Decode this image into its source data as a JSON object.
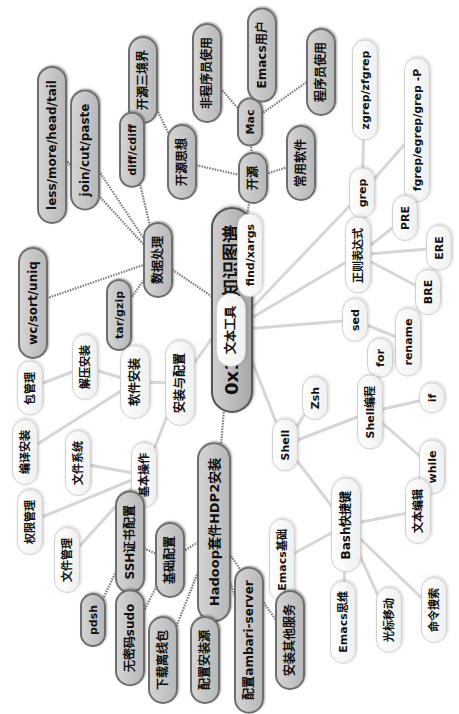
{
  "mindmap": {
    "root": {
      "id": "root",
      "label": "0x1 Linux知识图谱",
      "x": 232,
      "y": 310
    },
    "nodes": [
      {
        "id": "kaiyuan",
        "label": "开源",
        "x": 253,
        "y": 178,
        "style": "gray",
        "size": "m"
      },
      {
        "id": "mac",
        "label": "Mac",
        "x": 250,
        "y": 122,
        "style": "gray",
        "size": "s"
      },
      {
        "id": "emacs_user",
        "label": "Emacs用户",
        "x": 262,
        "y": 55,
        "style": "gray",
        "size": "m"
      },
      {
        "id": "programmer_use",
        "label": "程序员使用",
        "x": 321,
        "y": 72,
        "style": "gray",
        "size": "m"
      },
      {
        "id": "non_programmer_use",
        "label": "非程序员使用",
        "x": 207,
        "y": 73,
        "style": "gray",
        "size": "m"
      },
      {
        "id": "kaiyuan_sixiang",
        "label": "开源思想",
        "x": 182,
        "y": 162,
        "style": "gray",
        "size": "m"
      },
      {
        "id": "kaiyuan_sanjingjie",
        "label": "开源三境界",
        "x": 143,
        "y": 80,
        "style": "gray",
        "size": "m"
      },
      {
        "id": "changyong_ruanjian",
        "label": "常用软件",
        "x": 301,
        "y": 163,
        "style": "gray",
        "size": "m"
      },
      {
        "id": "shuju_chuli",
        "label": "数据处理",
        "x": 158,
        "y": 260,
        "style": "gray",
        "size": "m"
      },
      {
        "id": "less_more",
        "label": "less/more/head/tail",
        "x": 52,
        "y": 145,
        "style": "gray",
        "size": "m"
      },
      {
        "id": "join_cut",
        "label": "join/cut/paste",
        "x": 85,
        "y": 150,
        "style": "gray",
        "size": "m"
      },
      {
        "id": "diff",
        "label": "diff/cdiff",
        "x": 132,
        "y": 150,
        "style": "gray",
        "size": "s"
      },
      {
        "id": "wc_sort",
        "label": "wc/sort/uniq",
        "x": 33,
        "y": 303,
        "style": "gray",
        "size": "m"
      },
      {
        "id": "tar_gzip",
        "label": "tar/gzip",
        "x": 119,
        "y": 315,
        "style": "gray",
        "size": "s"
      },
      {
        "id": "wenben_gongju",
        "label": "文本工具",
        "x": 231,
        "y": 330,
        "style": "white",
        "size": "m"
      },
      {
        "id": "find_xargs",
        "label": "find/xargs",
        "x": 250,
        "y": 255,
        "style": "white",
        "size": "s"
      },
      {
        "id": "grep",
        "label": "grep",
        "x": 362,
        "y": 193,
        "style": "white",
        "size": "s"
      },
      {
        "id": "zgrep",
        "label": "zgrep/zfgrep",
        "x": 365,
        "y": 90,
        "style": "white",
        "size": "s"
      },
      {
        "id": "fgrep",
        "label": "fgrep/egrep/grep -P",
        "x": 417,
        "y": 130,
        "style": "white",
        "size": "s"
      },
      {
        "id": "zhengze",
        "label": "正则表达式",
        "x": 358,
        "y": 255,
        "style": "white",
        "size": "s"
      },
      {
        "id": "pre",
        "label": "PRE",
        "x": 405,
        "y": 218,
        "style": "white",
        "size": "s"
      },
      {
        "id": "ere",
        "label": "ERE",
        "x": 439,
        "y": 248,
        "style": "white",
        "size": "s"
      },
      {
        "id": "bre",
        "label": "BRE",
        "x": 428,
        "y": 292,
        "style": "white",
        "size": "s"
      },
      {
        "id": "sed",
        "label": "sed",
        "x": 355,
        "y": 320,
        "style": "white",
        "size": "s"
      },
      {
        "id": "rename",
        "label": "rename",
        "x": 408,
        "y": 342,
        "style": "white",
        "size": "s"
      },
      {
        "id": "for",
        "label": "for",
        "x": 380,
        "y": 358,
        "style": "white",
        "size": "s"
      },
      {
        "id": "shell",
        "label": "Shell",
        "x": 285,
        "y": 445,
        "style": "white",
        "size": "s"
      },
      {
        "id": "zsh",
        "label": "Zsh",
        "x": 315,
        "y": 398,
        "style": "white",
        "size": "s"
      },
      {
        "id": "shell_biancheng",
        "label": "Shell编程",
        "x": 370,
        "y": 412,
        "style": "white",
        "size": "s"
      },
      {
        "id": "if",
        "label": "if",
        "x": 432,
        "y": 398,
        "style": "white",
        "size": "s"
      },
      {
        "id": "while",
        "label": "while",
        "x": 432,
        "y": 467,
        "style": "white",
        "size": "s"
      },
      {
        "id": "bash_kuaijiejian",
        "label": "Bash快捷键",
        "x": 346,
        "y": 525,
        "style": "white",
        "size": "m"
      },
      {
        "id": "wenben_bianji",
        "label": "文本编辑",
        "x": 418,
        "y": 511,
        "style": "white",
        "size": "s"
      },
      {
        "id": "emacs_jichu",
        "label": "Emacs基础",
        "x": 282,
        "y": 560,
        "style": "white",
        "size": "s"
      },
      {
        "id": "emacs_siwei",
        "label": "Emacs思维",
        "x": 343,
        "y": 622,
        "style": "white",
        "size": "s"
      },
      {
        "id": "guangbiao_yidong",
        "label": "光标移动",
        "x": 389,
        "y": 620,
        "style": "white",
        "size": "s"
      },
      {
        "id": "mingling_sousuo",
        "label": "命令搜索",
        "x": 434,
        "y": 610,
        "style": "white",
        "size": "s"
      },
      {
        "id": "anzhuang_peizhi",
        "label": "安装与配置",
        "x": 180,
        "y": 383,
        "style": "white",
        "size": "m"
      },
      {
        "id": "ruanjian_anzhuang",
        "label": "软件安装",
        "x": 135,
        "y": 382,
        "style": "white",
        "size": "m"
      },
      {
        "id": "jieya_anzhuang",
        "label": "解压安装",
        "x": 85,
        "y": 367,
        "style": "white",
        "size": "s"
      },
      {
        "id": "bao_guanli",
        "label": "包管理",
        "x": 30,
        "y": 388,
        "style": "white",
        "size": "s"
      },
      {
        "id": "bianyi_anzhuang",
        "label": "编译安装",
        "x": 25,
        "y": 452,
        "style": "white",
        "size": "s"
      },
      {
        "id": "wenjian_xitong",
        "label": "文件系统",
        "x": 78,
        "y": 463,
        "style": "white",
        "size": "s"
      },
      {
        "id": "jiben_caozuo",
        "label": "基本操作",
        "x": 144,
        "y": 475,
        "style": "white",
        "size": "s"
      },
      {
        "id": "quanxian_guanli",
        "label": "权限管理",
        "x": 30,
        "y": 522,
        "style": "white",
        "size": "s"
      },
      {
        "id": "wenjian_guanli",
        "label": "文件管理",
        "x": 67,
        "y": 560,
        "style": "white",
        "size": "s"
      },
      {
        "id": "hadoop",
        "label": "Hadoop套件HDP2安装",
        "x": 214,
        "y": 532,
        "style": "gray",
        "size": "l"
      },
      {
        "id": "ssh_peizhi",
        "label": "SSH证书配置",
        "x": 130,
        "y": 542,
        "style": "gray",
        "size": "m"
      },
      {
        "id": "jichu_peizhi",
        "label": "基础配置",
        "x": 170,
        "y": 560,
        "style": "gray",
        "size": "m"
      },
      {
        "id": "pdsh",
        "label": "pdsh",
        "x": 93,
        "y": 620,
        "style": "gray",
        "size": "s"
      },
      {
        "id": "wumima_sudo",
        "label": "无密码sudo",
        "x": 130,
        "y": 638,
        "style": "gray",
        "size": "m"
      },
      {
        "id": "xiazai_lixianbao",
        "label": "下载离线包",
        "x": 163,
        "y": 660,
        "style": "gray",
        "size": "m"
      },
      {
        "id": "peizhi_anzhuangyuan",
        "label": "配置安装源",
        "x": 205,
        "y": 660,
        "style": "gray",
        "size": "m"
      },
      {
        "id": "peizhi_ambari",
        "label": "配置ambari-server",
        "x": 249,
        "y": 640,
        "style": "gray",
        "size": "m"
      },
      {
        "id": "anzhuang_qita",
        "label": "安装其他服务",
        "x": 290,
        "y": 640,
        "style": "gray",
        "size": "m"
      }
    ],
    "edges": [
      [
        "root",
        "kaiyuan",
        "dark"
      ],
      [
        "kaiyuan",
        "mac",
        "dark"
      ],
      [
        "mac",
        "emacs_user",
        "dark"
      ],
      [
        "mac",
        "programmer_use",
        "dark"
      ],
      [
        "mac",
        "non_programmer_use",
        "dark"
      ],
      [
        "kaiyuan",
        "kaiyuan_sixiang",
        "dark"
      ],
      [
        "kaiyuan_sixiang",
        "kaiyuan_sanjingjie",
        "dark"
      ],
      [
        "kaiyuan",
        "changyong_ruanjian",
        "dark"
      ],
      [
        "root",
        "shuju_chuli",
        "dark"
      ],
      [
        "shuju_chuli",
        "less_more",
        "dark"
      ],
      [
        "shuju_chuli",
        "join_cut",
        "dark"
      ],
      [
        "shuju_chuli",
        "diff",
        "dark"
      ],
      [
        "shuju_chuli",
        "wc_sort",
        "dark"
      ],
      [
        "shuju_chuli",
        "tar_gzip",
        "dark"
      ],
      [
        "root",
        "wenben_gongju",
        "light"
      ],
      [
        "wenben_gongju",
        "find_xargs",
        "light"
      ],
      [
        "wenben_gongju",
        "grep",
        "light"
      ],
      [
        "grep",
        "zgrep",
        "light"
      ],
      [
        "grep",
        "fgrep",
        "light"
      ],
      [
        "wenben_gongju",
        "zhengze",
        "light"
      ],
      [
        "zhengze",
        "pre",
        "light"
      ],
      [
        "zhengze",
        "ere",
        "light"
      ],
      [
        "zhengze",
        "bre",
        "light"
      ],
      [
        "wenben_gongju",
        "sed",
        "light"
      ],
      [
        "sed",
        "rename",
        "light"
      ],
      [
        "root",
        "shell",
        "light"
      ],
      [
        "shell",
        "zsh",
        "light"
      ],
      [
        "shell",
        "shell_biancheng",
        "light"
      ],
      [
        "shell_biancheng",
        "for",
        "light"
      ],
      [
        "shell_biancheng",
        "if",
        "light"
      ],
      [
        "shell_biancheng",
        "while",
        "light"
      ],
      [
        "shell",
        "bash_kuaijiejian",
        "light"
      ],
      [
        "bash_kuaijiejian",
        "wenben_bianji",
        "light"
      ],
      [
        "bash_kuaijiejian",
        "emacs_jichu",
        "light"
      ],
      [
        "bash_kuaijiejian",
        "emacs_siwei",
        "light"
      ],
      [
        "bash_kuaijiejian",
        "guangbiao_yidong",
        "light"
      ],
      [
        "bash_kuaijiejian",
        "mingling_sousuo",
        "light"
      ],
      [
        "root",
        "anzhuang_peizhi",
        "light"
      ],
      [
        "anzhuang_peizhi",
        "ruanjian_anzhuang",
        "light"
      ],
      [
        "ruanjian_anzhuang",
        "jieya_anzhuang",
        "light"
      ],
      [
        "jieya_anzhuang",
        "bao_guanli",
        "light"
      ],
      [
        "ruanjian_anzhuang",
        "bianyi_anzhuang",
        "light"
      ],
      [
        "anzhuang_peizhi",
        "jiben_caozuo",
        "light"
      ],
      [
        "jiben_caozuo",
        "wenjian_xitong",
        "light"
      ],
      [
        "jiben_caozuo",
        "quanxian_guanli",
        "light"
      ],
      [
        "jiben_caozuo",
        "wenjian_guanli",
        "light"
      ],
      [
        "root",
        "hadoop",
        "dark"
      ],
      [
        "hadoop",
        "jichu_peizhi",
        "dark"
      ],
      [
        "jichu_peizhi",
        "ssh_peizhi",
        "dark"
      ],
      [
        "ssh_peizhi",
        "pdsh",
        "dark"
      ],
      [
        "jichu_peizhi",
        "wumima_sudo",
        "dark"
      ],
      [
        "hadoop",
        "xiazai_lixianbao",
        "dark"
      ],
      [
        "hadoop",
        "peizhi_anzhuangyuan",
        "dark"
      ],
      [
        "hadoop",
        "peizhi_ambari",
        "dark"
      ],
      [
        "hadoop",
        "anzhuang_qita",
        "dark"
      ]
    ],
    "colors": {
      "dark_edge": "#7a7a7a",
      "light_edge": "#d6d6d6"
    }
  }
}
